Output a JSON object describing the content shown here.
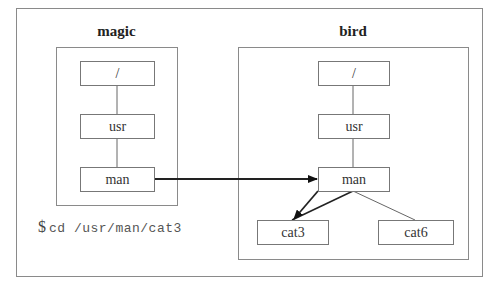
{
  "hosts": [
    {
      "name": "magic",
      "nodes": {
        "root": "/",
        "usr": "usr",
        "man": "man"
      }
    },
    {
      "name": "bird",
      "nodes": {
        "root": "/",
        "usr": "usr",
        "man": "man",
        "cat3": "cat3",
        "cat6": "cat6"
      }
    }
  ],
  "command": {
    "prompt": "$",
    "text": "cd /usr/man/cat3"
  },
  "colors": {
    "frame": "#8a8a8a",
    "node_border": "#777777",
    "edge": "#666666",
    "arrow": "#111111"
  }
}
